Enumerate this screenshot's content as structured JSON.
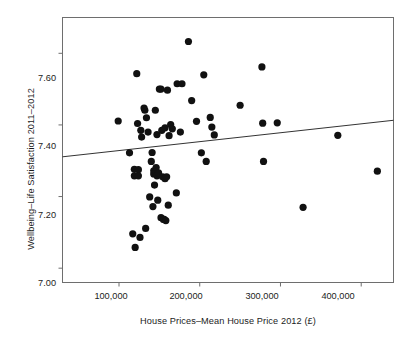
{
  "chart_data": {
    "type": "scatter",
    "title": "",
    "xlabel": "House Prices–Mean House Price 2012 (£)",
    "ylabel": "Wellbeing–Life Satisfaction 2011–2012",
    "xlim": [
      30000,
      440000
    ],
    "ylim": [
      6.96,
      7.7
    ],
    "grid": false,
    "legend": null,
    "xticks": [
      100000,
      200000,
      300000,
      400000
    ],
    "xtick_labels": [
      "100,000",
      "200,000",
      "300,000",
      "400,000"
    ],
    "yticks": [
      7.0,
      7.2,
      7.4,
      7.6
    ],
    "ytick_labels": [
      "7.00",
      "7.20",
      "7.40",
      "7.60"
    ],
    "marker_color": "#111111",
    "marker_size": 4.6,
    "line_color": "#333333",
    "trendline": {
      "label": "linear fit",
      "x": [
        30000,
        440000
      ],
      "y": [
        7.311,
        7.413
      ]
    },
    "points": [
      {
        "x": 99000,
        "y": 7.411
      },
      {
        "x": 113000,
        "y": 7.322
      },
      {
        "x": 117000,
        "y": 7.096
      },
      {
        "x": 119000,
        "y": 7.276
      },
      {
        "x": 119000,
        "y": 7.258
      },
      {
        "x": 120000,
        "y": 7.058
      },
      {
        "x": 122000,
        "y": 7.543
      },
      {
        "x": 123000,
        "y": 7.404
      },
      {
        "x": 124000,
        "y": 7.275
      },
      {
        "x": 124000,
        "y": 7.258
      },
      {
        "x": 126000,
        "y": 7.086
      },
      {
        "x": 127000,
        "y": 7.385
      },
      {
        "x": 128000,
        "y": 7.366
      },
      {
        "x": 131000,
        "y": 7.447
      },
      {
        "x": 132000,
        "y": 7.441
      },
      {
        "x": 133000,
        "y": 7.111
      },
      {
        "x": 134000,
        "y": 7.42
      },
      {
        "x": 136000,
        "y": 7.38
      },
      {
        "x": 138000,
        "y": 7.199
      },
      {
        "x": 140000,
        "y": 7.298
      },
      {
        "x": 141000,
        "y": 7.323
      },
      {
        "x": 142000,
        "y": 7.172
      },
      {
        "x": 143000,
        "y": 7.272
      },
      {
        "x": 143000,
        "y": 7.263
      },
      {
        "x": 144000,
        "y": 7.232
      },
      {
        "x": 145000,
        "y": 7.268
      },
      {
        "x": 145000,
        "y": 7.441
      },
      {
        "x": 146000,
        "y": 7.281
      },
      {
        "x": 147000,
        "y": 7.258
      },
      {
        "x": 147000,
        "y": 7.373
      },
      {
        "x": 148000,
        "y": 7.19
      },
      {
        "x": 149000,
        "y": 7.266
      },
      {
        "x": 150000,
        "y": 7.5
      },
      {
        "x": 152000,
        "y": 7.5
      },
      {
        "x": 152000,
        "y": 7.141
      },
      {
        "x": 153000,
        "y": 7.385
      },
      {
        "x": 154000,
        "y": 7.255
      },
      {
        "x": 155000,
        "y": 7.136
      },
      {
        "x": 156000,
        "y": 7.136
      },
      {
        "x": 157000,
        "y": 7.25
      },
      {
        "x": 157000,
        "y": 7.392
      },
      {
        "x": 158000,
        "y": 7.133
      },
      {
        "x": 159000,
        "y": 7.255
      },
      {
        "x": 160000,
        "y": 7.497
      },
      {
        "x": 161000,
        "y": 7.176
      },
      {
        "x": 162000,
        "y": 7.37
      },
      {
        "x": 164000,
        "y": 7.401
      },
      {
        "x": 166000,
        "y": 7.389
      },
      {
        "x": 171000,
        "y": 7.21
      },
      {
        "x": 172000,
        "y": 7.515
      },
      {
        "x": 176000,
        "y": 7.38
      },
      {
        "x": 178000,
        "y": 7.515
      },
      {
        "x": 186000,
        "y": 7.633
      },
      {
        "x": 190000,
        "y": 7.468
      },
      {
        "x": 196000,
        "y": 7.41
      },
      {
        "x": 202000,
        "y": 7.322
      },
      {
        "x": 205000,
        "y": 7.54
      },
      {
        "x": 208000,
        "y": 7.298
      },
      {
        "x": 213000,
        "y": 7.421
      },
      {
        "x": 215000,
        "y": 7.394
      },
      {
        "x": 218000,
        "y": 7.372
      },
      {
        "x": 250000,
        "y": 7.455
      },
      {
        "x": 277000,
        "y": 7.562
      },
      {
        "x": 278000,
        "y": 7.405
      },
      {
        "x": 279000,
        "y": 7.298
      },
      {
        "x": 296000,
        "y": 7.406
      },
      {
        "x": 328000,
        "y": 7.17
      },
      {
        "x": 371000,
        "y": 7.371
      },
      {
        "x": 420000,
        "y": 7.271
      }
    ]
  },
  "figure": {
    "caption": ""
  }
}
